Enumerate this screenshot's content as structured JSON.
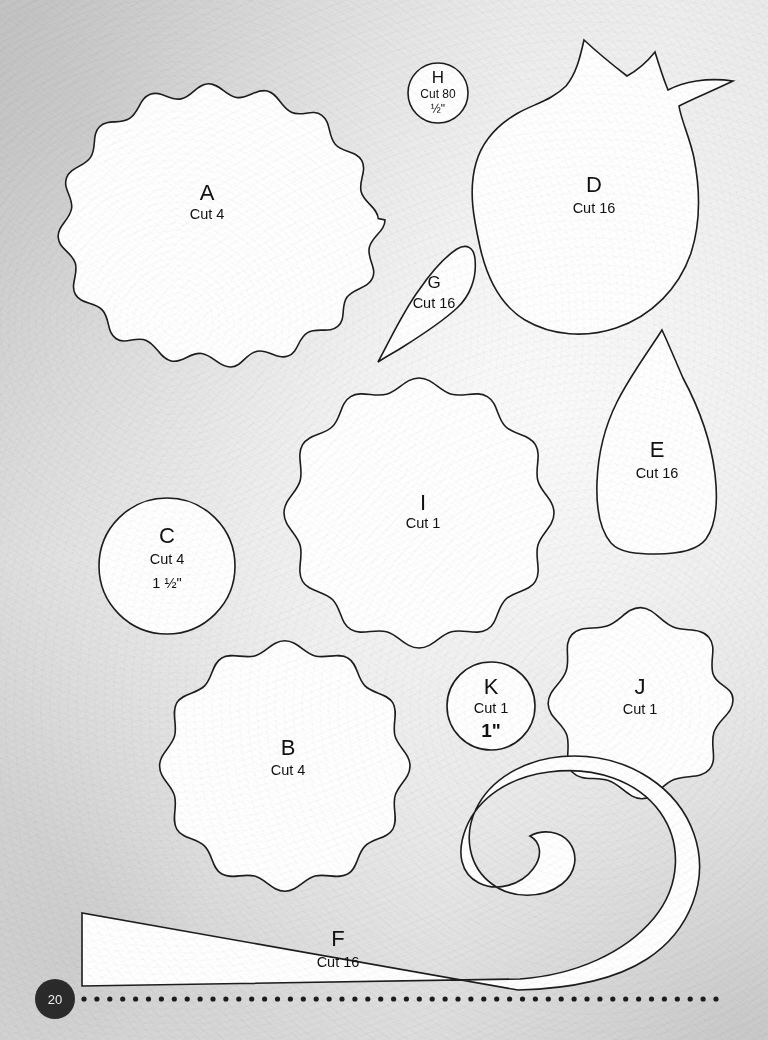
{
  "page": {
    "number": "20",
    "background_color": "#dcdcdc",
    "ink_color": "#1d1d1d",
    "paper_color": "#ffffff"
  },
  "footer": {
    "page_badge": "20",
    "dotted_rule": {
      "dot_count": 50,
      "start_x": 84,
      "end_x": 716,
      "y": 999,
      "radius": 2.6,
      "color": "#1c1c1c"
    }
  },
  "pieces": [
    {
      "id": "A",
      "letter": "A",
      "cut": "Cut 4",
      "size": "",
      "shape": "scalloped-circle",
      "cx": 207,
      "cy": 220,
      "r": 178,
      "scallops": 18,
      "amp": 13,
      "label_x": 207,
      "label_y": 200,
      "cut_y": 219
    },
    {
      "id": "B",
      "letter": "B",
      "cut": "Cut 4",
      "size": "",
      "shape": "scalloped-circle",
      "cx": 288,
      "cy": 766,
      "r": 122,
      "scallops": 16,
      "amp": 11,
      "label_x": 288,
      "label_y": 755,
      "cut_y": 775
    },
    {
      "id": "C",
      "letter": "C",
      "cut": "Cut 4",
      "size": "1 ½\"",
      "shape": "circle",
      "cx": 167,
      "cy": 566,
      "r": 68,
      "label_x": 167,
      "label_y": 543,
      "cut_y": 564,
      "size_y": 588
    },
    {
      "id": "D",
      "letter": "D",
      "cut": "Cut 16",
      "size": "",
      "shape": "pomegranate",
      "label_x": 594,
      "label_y": 192,
      "cut_y": 213
    },
    {
      "id": "E",
      "letter": "E",
      "cut": "Cut 16",
      "size": "",
      "shape": "petal",
      "label_x": 657,
      "label_y": 457,
      "cut_y": 478
    },
    {
      "id": "F",
      "letter": "F",
      "cut": "Cut 16",
      "size": "",
      "shape": "hook-strip",
      "label_x": 338,
      "label_y": 946,
      "cut_y": 967
    },
    {
      "id": "G",
      "letter": "G",
      "cut": "Cut 16",
      "size": "",
      "shape": "teardrop",
      "label_x": 434,
      "label_y": 288,
      "cut_y": 308
    },
    {
      "id": "H",
      "letter": "H",
      "cut": "Cut 80",
      "size": "½\"",
      "shape": "circle",
      "cx": 438,
      "cy": 93,
      "r": 30,
      "label_x": 438,
      "label_y": 83,
      "cut_y": 98,
      "size_y": 113
    },
    {
      "id": "I",
      "letter": "I",
      "cut": "Cut 1",
      "size": "",
      "shape": "scalloped-circle",
      "cx": 423,
      "cy": 513,
      "r": 131,
      "scallops": 16,
      "amp": 11,
      "label_x": 423,
      "label_y": 510,
      "cut_y": 528
    },
    {
      "id": "J",
      "letter": "J",
      "cut": "Cut 1",
      "size": "",
      "shape": "scalloped-circle",
      "cx": 640,
      "cy": 700,
      "r": 85,
      "scallops": 10,
      "amp": 12,
      "label_x": 640,
      "label_y": 694,
      "cut_y": 714
    },
    {
      "id": "K",
      "letter": "K",
      "cut": "Cut 1",
      "size": "1\"",
      "shape": "circle",
      "cx": 491,
      "cy": 706,
      "r": 44,
      "label_x": 491,
      "label_y": 694,
      "cut_y": 713,
      "size_y": 737
    }
  ]
}
